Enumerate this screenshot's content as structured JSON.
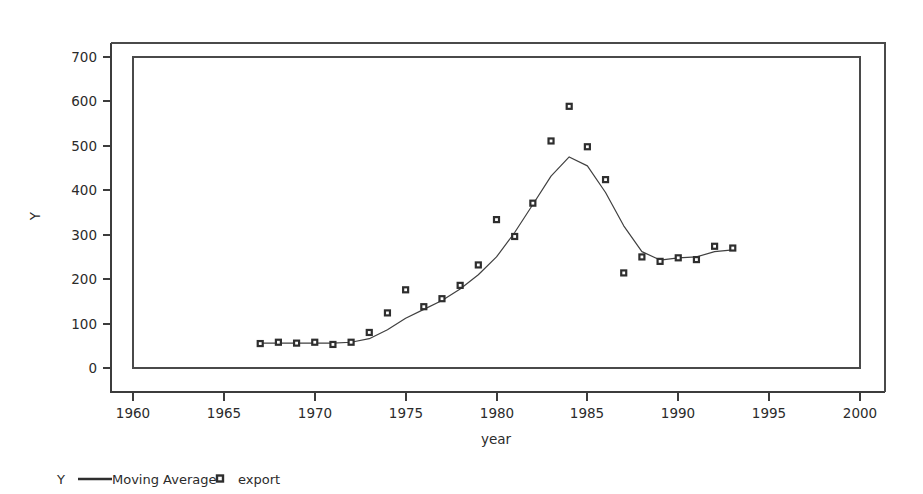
{
  "chart_data": {
    "type": "line",
    "title": "",
    "xlabel": "year",
    "ylabel": "Y",
    "xlim": [
      1958,
      2002
    ],
    "ylim": [
      0,
      700
    ],
    "xticks": [
      1960,
      1965,
      1970,
      1975,
      1980,
      1985,
      1990,
      1995,
      2000
    ],
    "yticks": [
      0,
      100,
      200,
      300,
      400,
      500,
      600,
      700
    ],
    "grid": false,
    "legend_position": "bottom-left",
    "legend_group_label": "Y",
    "series": [
      {
        "name": "Moving Average",
        "marker": "none",
        "style": "line",
        "x": [
          1967,
          1968,
          1969,
          1970,
          1971,
          1972,
          1973,
          1974,
          1975,
          1976,
          1977,
          1978,
          1979,
          1980,
          1981,
          1982,
          1983,
          1984,
          1985,
          1986,
          1987,
          1988,
          1989,
          1990,
          1991,
          1992,
          1993
        ],
        "values": [
          56,
          56,
          56,
          56,
          56,
          58,
          66,
          86,
          112,
          132,
          152,
          178,
          210,
          250,
          305,
          368,
          432,
          475,
          455,
          395,
          320,
          262,
          243,
          248,
          250,
          262,
          266
        ]
      },
      {
        "name": "export",
        "marker": "square",
        "style": "scatter",
        "x": [
          1967,
          1968,
          1969,
          1970,
          1971,
          1972,
          1973,
          1974,
          1975,
          1976,
          1977,
          1978,
          1979,
          1980,
          1981,
          1982,
          1983,
          1984,
          1985,
          1986,
          1987,
          1988,
          1989,
          1990,
          1991,
          1992,
          1993
        ],
        "values": [
          55,
          58,
          56,
          58,
          53,
          58,
          80,
          124,
          176,
          138,
          156,
          186,
          232,
          334,
          296,
          371,
          511,
          589,
          498,
          424,
          214,
          250,
          240,
          248,
          244,
          274,
          270
        ]
      }
    ]
  },
  "axes": {
    "y_label": "Y",
    "x_label": "year",
    "y_tick_labels": [
      "700",
      "600",
      "500",
      "400",
      "300",
      "200",
      "100",
      "0"
    ],
    "x_tick_labels": [
      "1960",
      "1965",
      "1970",
      "1975",
      "1980",
      "1985",
      "1990",
      "1995",
      "2000"
    ]
  },
  "legend": {
    "group_label": "Y",
    "items": [
      {
        "label": "Moving Average",
        "glyph": "line-glyph"
      },
      {
        "label": "export",
        "glyph": "square-marker-glyph"
      }
    ]
  },
  "colors": {
    "line": "#404040",
    "marker_stroke": "#2e2e2e",
    "axis": "#3c3c3c",
    "text": "#2b2b2b",
    "background": "#ffffff"
  }
}
